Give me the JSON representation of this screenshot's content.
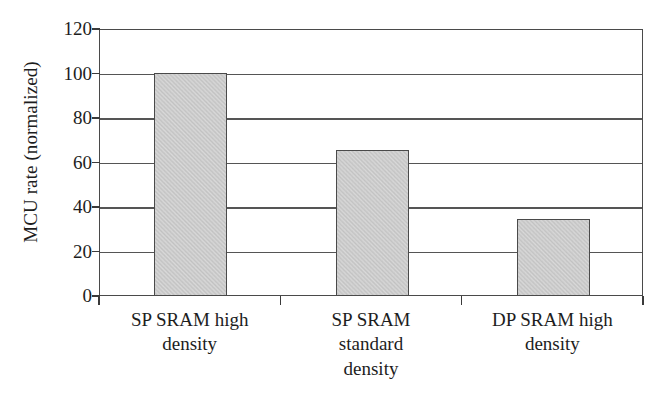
{
  "chart_data": {
    "type": "bar",
    "title": "",
    "subtitle": "",
    "xlabel": "",
    "ylabel": "MCU rate (normalized)",
    "categories": [
      "SP SRAM high density",
      "SP SRAM standard density",
      "DP SRAM high density"
    ],
    "category_lines": [
      [
        "SP SRAM high",
        "density"
      ],
      [
        "SP SRAM",
        "standard",
        "density"
      ],
      [
        "DP SRAM high",
        "density"
      ]
    ],
    "values": [
      100,
      65,
      34
    ],
    "ylim": [
      0,
      120
    ],
    "ytick_values": [
      0,
      20,
      40,
      60,
      80,
      100,
      120
    ],
    "ytick_labels": [
      "0",
      "20",
      "40",
      "60",
      "80",
      "100",
      "120"
    ],
    "grid": "horizontal",
    "legend": "none",
    "bar_fill_color": "#d2d2d2",
    "bar_edge_color": "#4a4a4a",
    "axis_color": "#4a4a4a",
    "gridline_color": "#555555",
    "background_color": "#ffffff"
  }
}
